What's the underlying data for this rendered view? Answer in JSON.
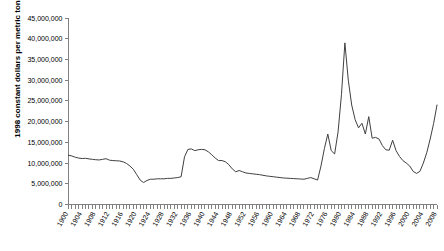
{
  "chart_data": {
    "type": "line",
    "title": "",
    "subtitle": "",
    "xlabel": "",
    "ylabel": "1998 constant dollars per metric ton",
    "ylim": [
      0,
      45000000
    ],
    "xlim": [
      1900,
      2008
    ],
    "grid": false,
    "legend": null,
    "legend_position": "none",
    "y_tick_labels": [
      "0",
      "5,000,000",
      "10,000,000",
      "15,000,000",
      "20,000,000",
      "25,000,000",
      "30,000,000",
      "35,000,000",
      "40,000,000",
      "45,000,000"
    ],
    "y_tick_values": [
      0,
      5000000,
      10000000,
      15000000,
      20000000,
      25000000,
      30000000,
      35000000,
      40000000,
      45000000
    ],
    "x_tick_labels": [
      "1900",
      "1904",
      "1908",
      "1912",
      "1916",
      "1920",
      "1924",
      "1928",
      "1932",
      "1936",
      "1940",
      "1944",
      "1948",
      "1952",
      "1956",
      "1960",
      "1964",
      "1968",
      "1972",
      "1976",
      "1980",
      "1984",
      "1988",
      "1992",
      "1996",
      "2000",
      "2004",
      "2008"
    ],
    "x_tick_values": [
      1900,
      1904,
      1908,
      1912,
      1916,
      1920,
      1924,
      1928,
      1932,
      1936,
      1940,
      1944,
      1948,
      1952,
      1956,
      1960,
      1964,
      1968,
      1972,
      1976,
      1980,
      1984,
      1988,
      1992,
      1996,
      2000,
      2004,
      2008
    ],
    "x": [
      1900,
      1901,
      1902,
      1903,
      1904,
      1905,
      1906,
      1907,
      1908,
      1909,
      1910,
      1911,
      1912,
      1913,
      1914,
      1915,
      1916,
      1917,
      1918,
      1919,
      1920,
      1921,
      1922,
      1923,
      1924,
      1925,
      1926,
      1927,
      1928,
      1929,
      1930,
      1931,
      1932,
      1933,
      1934,
      1935,
      1936,
      1937,
      1938,
      1939,
      1940,
      1941,
      1942,
      1943,
      1944,
      1945,
      1946,
      1947,
      1948,
      1949,
      1950,
      1951,
      1952,
      1953,
      1954,
      1955,
      1956,
      1957,
      1958,
      1959,
      1960,
      1961,
      1962,
      1963,
      1964,
      1965,
      1966,
      1967,
      1968,
      1969,
      1970,
      1971,
      1972,
      1973,
      1974,
      1975,
      1976,
      1977,
      1978,
      1979,
      1980,
      1981,
      1982,
      1983,
      1984,
      1985,
      1986,
      1987,
      1988,
      1989,
      1990,
      1991,
      1992,
      1993,
      1994,
      1995,
      1996,
      1997,
      1998,
      1999,
      2000,
      2001,
      2002,
      2003,
      2004,
      2005,
      2006,
      2007,
      2008
    ],
    "values": [
      11900000,
      11700000,
      11400000,
      11200000,
      11100000,
      11150000,
      11000000,
      10900000,
      10800000,
      10750000,
      10900000,
      11050000,
      10700000,
      10600000,
      10550000,
      10500000,
      10300000,
      9900000,
      9300000,
      8500000,
      7200000,
      5900000,
      5300000,
      5800000,
      6100000,
      6100000,
      6200000,
      6200000,
      6200000,
      6300000,
      6300000,
      6400000,
      6500000,
      6700000,
      11500000,
      13300000,
      13400000,
      13000000,
      13200000,
      13300000,
      13200000,
      12700000,
      12000000,
      11200000,
      10600000,
      10600000,
      10300000,
      9600000,
      8600000,
      7900000,
      8200000,
      7900000,
      7600000,
      7500000,
      7400000,
      7300000,
      7200000,
      7050000,
      6900000,
      6800000,
      6700000,
      6600000,
      6500000,
      6400000,
      6350000,
      6300000,
      6250000,
      6200000,
      6150000,
      6100000,
      6300000,
      6500000,
      6200000,
      5900000,
      9300000,
      13500000,
      17000000,
      13000000,
      12200000,
      17500000,
      26500000,
      39000000,
      30000000,
      24000000,
      20500000,
      18500000,
      19600000,
      17000000,
      21200000,
      16000000,
      16200000,
      15800000,
      14200000,
      13200000,
      13100000,
      15500000,
      13000000,
      11600000,
      10600000,
      10000000,
      9300000,
      8000000,
      7500000,
      8000000,
      10000000,
      12500000,
      15800000,
      19500000,
      24000000
    ],
    "series_name": "price per metric ton"
  }
}
